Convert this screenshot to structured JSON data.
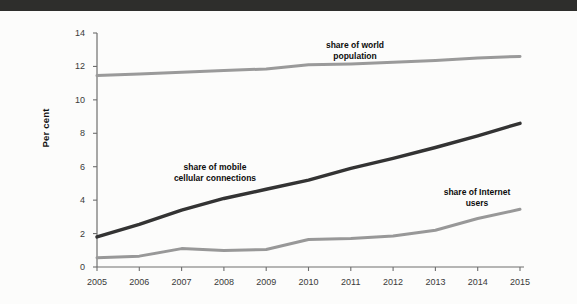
{
  "page": {
    "background_color": "#fcfcfb",
    "top_bar_color": "#2e2e2c"
  },
  "axis": {
    "ylabel": "Per cent",
    "yticks": [
      "0",
      "2",
      "4",
      "6",
      "8",
      "10",
      "12",
      "14"
    ],
    "xticks": [
      "2005",
      "2006",
      "2007",
      "2008",
      "2009",
      "2010",
      "2011",
      "2012",
      "2013",
      "2014",
      "2015"
    ]
  },
  "annotations": {
    "world": "share of world\npopulation",
    "world_line1": "share of world",
    "world_line2": "population",
    "mobile_line1": "share of mobile",
    "mobile_line2": "cellular connections",
    "internet_line1": "share of Internet",
    "internet_line2": "users"
  },
  "colors": {
    "world_population": "#9a9a9a",
    "mobile_cellular": "#333333",
    "internet_users": "#989898",
    "axis": "#6e6e6e",
    "text": "#2f2f2f"
  },
  "chart_data": {
    "type": "line",
    "title": "",
    "xlabel": "",
    "ylabel": "Per cent",
    "x": [
      2005,
      2006,
      2007,
      2008,
      2009,
      2010,
      2011,
      2012,
      2013,
      2014,
      2015
    ],
    "xlim": [
      2005,
      2015
    ],
    "ylim": [
      0,
      14
    ],
    "yticks": [
      0,
      2,
      4,
      6,
      8,
      10,
      12,
      14
    ],
    "grid": false,
    "legend": "inline-annotations",
    "series": [
      {
        "name": "share of world population",
        "color": "#9a9a9a",
        "values": [
          11.45,
          11.55,
          11.65,
          11.75,
          11.85,
          12.1,
          12.15,
          12.25,
          12.35,
          12.5,
          12.6
        ]
      },
      {
        "name": "share of mobile cellular connections",
        "color": "#333333",
        "values": [
          1.8,
          2.55,
          3.4,
          4.1,
          4.65,
          5.2,
          5.9,
          6.5,
          7.15,
          7.85,
          8.6
        ]
      },
      {
        "name": "share of Internet users",
        "color": "#989898",
        "values": [
          0.55,
          0.65,
          1.1,
          0.98,
          1.05,
          1.65,
          1.7,
          1.85,
          2.2,
          2.9,
          3.45
        ]
      }
    ]
  }
}
